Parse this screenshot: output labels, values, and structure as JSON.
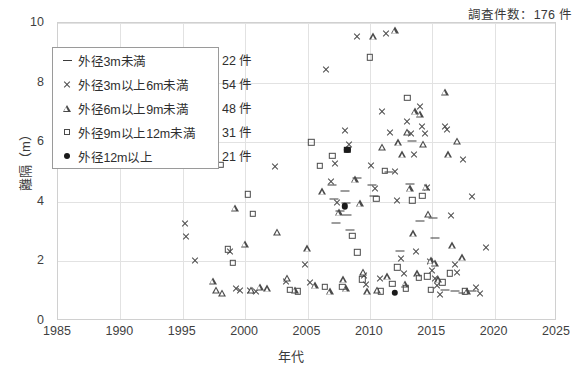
{
  "annotation": {
    "survey_count_text": "調査件数：176 件"
  },
  "axes": {
    "x_title": "年代",
    "y_title": "離隔（m）",
    "x_ticks": [
      "1985",
      "1990",
      "1995",
      "2000",
      "2005",
      "2010",
      "2015",
      "2020",
      "2025"
    ],
    "y_ticks": [
      "0",
      "2",
      "4",
      "6",
      "8",
      "10"
    ]
  },
  "legend": {
    "entries": [
      {
        "label": "外径3m未満",
        "count": "22 件",
        "marker": "dash-marker"
      },
      {
        "label": "外径3m以上6m未満",
        "count": "54 件",
        "marker": "cross-marker"
      },
      {
        "label": "外径6m以上9m未満",
        "count": "48 件",
        "marker": "triangle-marker"
      },
      {
        "label": "外径9m以上12m未満",
        "count": "31 件",
        "marker": "square-marker"
      },
      {
        "label": "外径12m以上",
        "count": "21 件",
        "marker": "dot-marker"
      }
    ]
  },
  "chart_data": {
    "type": "scatter",
    "title": "",
    "xlabel": "年代",
    "ylabel": "離隔（m）",
    "xlim": [
      1985,
      2025
    ],
    "ylim": [
      0,
      10
    ],
    "xticks": [
      1985,
      1990,
      1995,
      2000,
      2005,
      2010,
      2015,
      2020,
      2025
    ],
    "yticks": [
      0,
      2,
      4,
      6,
      8,
      10
    ],
    "grid": true,
    "legend_position": "upper-left-inside",
    "series": [
      {
        "name": "外径3m未満",
        "count": 22,
        "marker": "dash",
        "points": [
          [
            2007.0,
            4.55
          ],
          [
            2007.1,
            4.1
          ],
          [
            2007.6,
            3.7
          ],
          [
            2007.3,
            3.28
          ],
          [
            2008.0,
            4.35
          ],
          [
            2008.1,
            3.95
          ],
          [
            2008.2,
            3.55
          ],
          [
            2008.4,
            3.05
          ],
          [
            2009.0,
            4.8
          ],
          [
            2010.2,
            4.55
          ],
          [
            2010.3,
            4.2
          ],
          [
            2011.5,
            5.0
          ],
          [
            2012.4,
            2.35
          ],
          [
            2013.2,
            4.6
          ],
          [
            2013.4,
            6.05
          ],
          [
            2015.1,
            3.45
          ],
          [
            2015.2,
            2.8
          ],
          [
            2016.0,
            1.05
          ],
          [
            2016.8,
            1.0
          ],
          [
            2017.5,
            0.95
          ],
          [
            2018.2,
            1.0
          ],
          [
            2014.0,
            3.35
          ]
        ]
      },
      {
        "name": "外径3m以上6m未満",
        "count": 54,
        "marker": "cross",
        "points": [
          [
            1995.2,
            3.3
          ],
          [
            1995.3,
            2.85
          ],
          [
            1996.0,
            2.05
          ],
          [
            1998.8,
            2.35
          ],
          [
            1999.3,
            1.1
          ],
          [
            1999.6,
            1.05
          ],
          [
            2000.4,
            1.05
          ],
          [
            2000.9,
            1.0
          ],
          [
            2002.4,
            5.2
          ],
          [
            2003.3,
            1.35
          ],
          [
            2004.8,
            1.9
          ],
          [
            2005.2,
            1.3
          ],
          [
            2006.5,
            8.45
          ],
          [
            2006.9,
            4.7
          ],
          [
            2007.2,
            5.3
          ],
          [
            2007.4,
            4.0
          ],
          [
            2008.0,
            6.4
          ],
          [
            2008.3,
            5.95
          ],
          [
            2009.0,
            9.55
          ],
          [
            2009.5,
            1.55
          ],
          [
            2009.7,
            1.25
          ],
          [
            2010.1,
            5.25
          ],
          [
            2010.4,
            4.45
          ],
          [
            2010.8,
            1.45
          ],
          [
            2011.3,
            9.65
          ],
          [
            2011.6,
            6.35
          ],
          [
            2012.0,
            5.05
          ],
          [
            2012.2,
            4.05
          ],
          [
            2012.5,
            2.1
          ],
          [
            2012.7,
            1.6
          ],
          [
            2013.0,
            6.7
          ],
          [
            2013.3,
            6.3
          ],
          [
            2013.5,
            5.6
          ],
          [
            2013.7,
            2.35
          ],
          [
            2014.0,
            7.2
          ],
          [
            2014.2,
            6.55
          ],
          [
            2014.4,
            6.3
          ],
          [
            2014.6,
            4.5
          ],
          [
            2014.8,
            2.0
          ],
          [
            2015.0,
            1.7
          ],
          [
            2015.2,
            1.45
          ],
          [
            2015.4,
            1.2
          ],
          [
            2015.6,
            0.9
          ],
          [
            2016.0,
            6.55
          ],
          [
            2016.2,
            6.45
          ],
          [
            2016.5,
            3.55
          ],
          [
            2016.8,
            1.9
          ],
          [
            2017.0,
            1.65
          ],
          [
            2017.5,
            5.45
          ],
          [
            2018.2,
            4.2
          ],
          [
            2018.5,
            1.15
          ],
          [
            2018.8,
            0.95
          ],
          [
            2019.3,
            2.5
          ],
          [
            2011.0,
            7.05
          ]
        ]
      },
      {
        "name": "外径6m以上9m未満",
        "count": 48,
        "marker": "triangle",
        "points": [
          [
            1997.4,
            1.35
          ],
          [
            1997.7,
            1.05
          ],
          [
            1998.2,
            0.95
          ],
          [
            1999.2,
            3.8
          ],
          [
            2000.0,
            2.6
          ],
          [
            2000.5,
            1.05
          ],
          [
            2001.2,
            1.15
          ],
          [
            2001.8,
            1.1
          ],
          [
            2002.6,
            3.0
          ],
          [
            2003.4,
            1.45
          ],
          [
            2004.0,
            1.05
          ],
          [
            2005.0,
            2.45
          ],
          [
            2005.6,
            1.2
          ],
          [
            2006.2,
            4.35
          ],
          [
            2006.8,
            1.0
          ],
          [
            2007.5,
            3.65
          ],
          [
            2007.9,
            1.4
          ],
          [
            2008.1,
            1.1
          ],
          [
            2008.8,
            4.75
          ],
          [
            2009.2,
            3.95
          ],
          [
            2009.5,
            1.65
          ],
          [
            2009.8,
            1.0
          ],
          [
            2010.3,
            9.55
          ],
          [
            2010.6,
            1.05
          ],
          [
            2011.0,
            5.85
          ],
          [
            2011.4,
            1.5
          ],
          [
            2012.0,
            9.75
          ],
          [
            2012.3,
            6.0
          ],
          [
            2012.6,
            5.6
          ],
          [
            2013.0,
            6.35
          ],
          [
            2013.2,
            4.45
          ],
          [
            2013.5,
            2.95
          ],
          [
            2013.8,
            1.6
          ],
          [
            2014.0,
            6.95
          ],
          [
            2014.3,
            5.95
          ],
          [
            2014.5,
            4.5
          ],
          [
            2014.7,
            3.6
          ],
          [
            2014.9,
            2.05
          ],
          [
            2015.2,
            1.95
          ],
          [
            2015.5,
            1.4
          ],
          [
            2016.0,
            7.7
          ],
          [
            2016.3,
            5.6
          ],
          [
            2016.6,
            2.55
          ],
          [
            2017.0,
            6.05
          ],
          [
            2017.4,
            2.15
          ],
          [
            2017.8,
            1.0
          ],
          [
            2013.6,
            7.05
          ],
          [
            2012.8,
            1.25
          ]
        ]
      },
      {
        "name": "外径9m以上12m未満",
        "count": 31,
        "marker": "square",
        "points": [
          [
            1998.0,
            5.25
          ],
          [
            1998.6,
            2.4
          ],
          [
            1999.0,
            1.95
          ],
          [
            2000.2,
            4.25
          ],
          [
            2000.6,
            3.6
          ],
          [
            2003.6,
            1.05
          ],
          [
            2004.2,
            1.0
          ],
          [
            2006.0,
            5.2
          ],
          [
            2006.4,
            1.15
          ],
          [
            2007.0,
            5.55
          ],
          [
            2007.8,
            1.15
          ],
          [
            2008.6,
            2.85
          ],
          [
            2009.0,
            2.3
          ],
          [
            2009.4,
            1.4
          ],
          [
            2010.0,
            8.85
          ],
          [
            2010.5,
            4.1
          ],
          [
            2010.9,
            1.0
          ],
          [
            2011.2,
            5.05
          ],
          [
            2011.8,
            1.25
          ],
          [
            2012.2,
            1.8
          ],
          [
            2012.9,
            1.1
          ],
          [
            2013.0,
            7.5
          ],
          [
            2013.4,
            4.05
          ],
          [
            2013.9,
            1.45
          ],
          [
            2014.2,
            4.2
          ],
          [
            2014.6,
            1.5
          ],
          [
            2014.9,
            1.05
          ],
          [
            2015.8,
            1.3
          ],
          [
            2016.4,
            1.6
          ],
          [
            2017.6,
            1.0
          ],
          [
            2005.3,
            6.0
          ]
        ]
      },
      {
        "name": "外径12m以上",
        "count": 21,
        "marker": "dot",
        "points": [
          [
            2008.0,
            3.85
          ],
          [
            2012.0,
            0.95
          ],
          [
            2008.2,
            5.75
          ]
        ]
      }
    ]
  }
}
